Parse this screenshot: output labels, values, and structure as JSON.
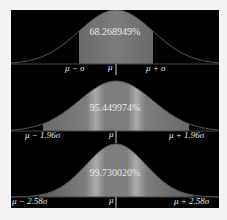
{
  "colors": {
    "background": "#000000",
    "fill": "#7a7a7a",
    "curve": "#555555",
    "text": "#e8e8e8"
  },
  "panels": [
    {
      "percentage": "68.268949%",
      "left_label": "μ − σ",
      "center_label": "μ",
      "right_label": "μ + σ",
      "k": 1
    },
    {
      "percentage": "95.449974%",
      "left_label": "μ − 1.96σ",
      "center_label": "μ",
      "right_label": "μ + 1.96σ",
      "k": 1.96
    },
    {
      "percentage": "99.730020%",
      "left_label": "μ − 2.58σ",
      "center_label": "μ",
      "right_label": "μ + 2.58σ",
      "k": 2.58
    }
  ]
}
